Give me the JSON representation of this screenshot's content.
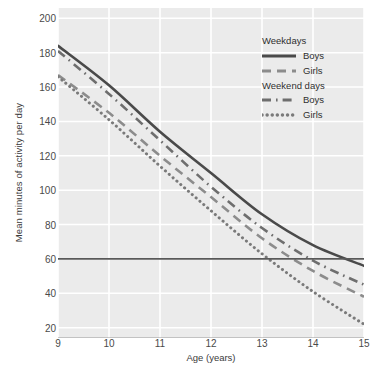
{
  "chart_data": {
    "type": "line",
    "title": "",
    "xlabel": "Age (years)",
    "ylabel": "Mean minutes of activity per day",
    "x": [
      9,
      10,
      11,
      12,
      13,
      14,
      15
    ],
    "xlim": [
      9,
      15
    ],
    "ylim": [
      14,
      206
    ],
    "xticks": [
      "9",
      "10",
      "11",
      "12",
      "13",
      "14",
      "15"
    ],
    "yticks": [
      "20",
      "40",
      "60",
      "80",
      "100",
      "120",
      "140",
      "160",
      "180",
      "200"
    ],
    "grid": true,
    "legend_position": "top-right",
    "reference_line": {
      "value": 60,
      "label": "",
      "color": "#595959"
    },
    "series": [
      {
        "name": "Weekdays Boys",
        "group": "Weekdays",
        "sex": "Boys",
        "style": "solid",
        "color": "#4a4a4a",
        "values": [
          184,
          161,
          134,
          110,
          86,
          68,
          56
        ]
      },
      {
        "name": "Weekdays Girls",
        "group": "Weekdays",
        "sex": "Girls",
        "style": "dashed",
        "color": "#8c8c8c",
        "values": [
          167,
          145,
          120,
          96,
          72,
          53,
          38
        ]
      },
      {
        "name": "Weekend days Boys",
        "group": "Weekend days",
        "sex": "Boys",
        "style": "dashdot",
        "color": "#6e6e6e",
        "values": [
          181,
          156,
          129,
          102,
          78,
          59,
          45
        ]
      },
      {
        "name": "Weekend days Girls",
        "group": "Weekend days",
        "sex": "Girls",
        "style": "dotted",
        "color": "#7a7a7a",
        "values": [
          166,
          141,
          114,
          88,
          63,
          41,
          22
        ]
      }
    ]
  },
  "legend": {
    "group1_title": "Weekdays",
    "group1_items": [
      {
        "label": "Boys",
        "style": "solid"
      },
      {
        "label": "Girls",
        "style": "dashed"
      }
    ],
    "group2_title": "Weekend days",
    "group2_items": [
      {
        "label": "Boys",
        "style": "dashdot"
      },
      {
        "label": "Girls",
        "style": "dotted"
      }
    ]
  },
  "colors": {
    "plot_background": "#ebebeb",
    "gridline": "#ffffff",
    "axis": "#9a9a9a",
    "text": "#3b3b3b"
  }
}
